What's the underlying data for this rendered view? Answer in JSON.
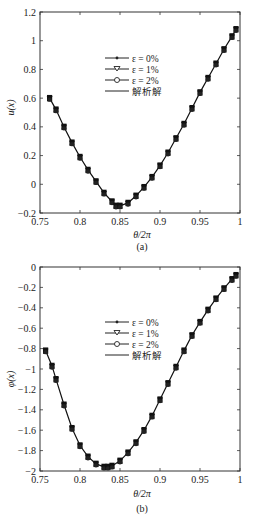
{
  "chart_data": [
    {
      "type": "line",
      "panel": "(a)",
      "title": "",
      "xlabel": "θ/2π",
      "ylabel": "u(x)",
      "xlim": [
        0.75,
        1.0
      ],
      "ylim": [
        -0.2,
        1.2
      ],
      "xticks": [
        "0.75",
        "0.8",
        "0.85",
        "0.9",
        "0.95",
        "1"
      ],
      "yticks": [
        "-0.2",
        "0",
        "0.2",
        "0.4",
        "0.6",
        "0.8",
        "1",
        "1.2"
      ],
      "legend": [
        "ε = 0%",
        "ε = 1%",
        "ε = 2%",
        "解析解"
      ],
      "legend_position": "upper-center",
      "grid": false,
      "x": [
        0.762,
        0.77,
        0.78,
        0.79,
        0.8,
        0.81,
        0.82,
        0.83,
        0.84,
        0.845,
        0.85,
        0.86,
        0.87,
        0.88,
        0.89,
        0.9,
        0.91,
        0.92,
        0.93,
        0.94,
        0.95,
        0.96,
        0.97,
        0.98,
        0.99,
        0.995
      ],
      "series": [
        {
          "name": "ε = 0%",
          "values": [
            0.6,
            0.52,
            0.4,
            0.29,
            0.19,
            0.1,
            0.02,
            -0.06,
            -0.12,
            -0.15,
            -0.15,
            -0.13,
            -0.08,
            -0.02,
            0.05,
            0.13,
            0.22,
            0.32,
            0.42,
            0.53,
            0.64,
            0.74,
            0.84,
            0.94,
            1.03,
            1.08
          ]
        },
        {
          "name": "ε = 1%",
          "values": [
            0.6,
            0.52,
            0.4,
            0.29,
            0.19,
            0.1,
            0.02,
            -0.06,
            -0.12,
            -0.15,
            -0.15,
            -0.13,
            -0.08,
            -0.02,
            0.05,
            0.13,
            0.22,
            0.32,
            0.42,
            0.53,
            0.64,
            0.74,
            0.84,
            0.94,
            1.03,
            1.08
          ]
        },
        {
          "name": "ε = 2%",
          "values": [
            0.6,
            0.52,
            0.4,
            0.29,
            0.19,
            0.1,
            0.02,
            -0.06,
            -0.12,
            -0.15,
            -0.15,
            -0.13,
            -0.08,
            -0.02,
            0.05,
            0.13,
            0.22,
            0.32,
            0.42,
            0.53,
            0.64,
            0.74,
            0.84,
            0.94,
            1.03,
            1.08
          ]
        },
        {
          "name": "解析解",
          "values": [
            0.6,
            0.52,
            0.4,
            0.29,
            0.19,
            0.1,
            0.02,
            -0.06,
            -0.12,
            -0.15,
            -0.15,
            -0.13,
            -0.08,
            -0.02,
            0.05,
            0.13,
            0.22,
            0.32,
            0.42,
            0.53,
            0.64,
            0.74,
            0.84,
            0.94,
            1.03,
            1.08
          ]
        }
      ]
    },
    {
      "type": "line",
      "panel": "(b)",
      "title": "",
      "xlabel": "θ/2π",
      "ylabel": "φ(x)",
      "xlim": [
        0.75,
        1.0
      ],
      "ylim": [
        -2.0,
        0.0
      ],
      "xticks": [
        "0.75",
        "0.8",
        "0.85",
        "0.9",
        "0.95",
        "1"
      ],
      "yticks": [
        "-2",
        "-1.8",
        "-1.6",
        "-1.4",
        "-1.2",
        "-1",
        "-0.8",
        "-0.6",
        "-0.4",
        "-0.2",
        "0"
      ],
      "legend": [
        "ε = 0%",
        "ε = 1%",
        "ε = 2%",
        "解析解"
      ],
      "legend_position": "upper-center",
      "grid": false,
      "x": [
        0.757,
        0.765,
        0.77,
        0.78,
        0.79,
        0.8,
        0.81,
        0.82,
        0.83,
        0.835,
        0.84,
        0.85,
        0.86,
        0.87,
        0.88,
        0.89,
        0.9,
        0.91,
        0.92,
        0.93,
        0.94,
        0.95,
        0.96,
        0.97,
        0.98,
        0.99,
        0.995
      ],
      "series": [
        {
          "name": "ε = 0%",
          "values": [
            -0.82,
            -0.97,
            -1.1,
            -1.35,
            -1.58,
            -1.75,
            -1.86,
            -1.93,
            -1.96,
            -1.96,
            -1.95,
            -1.9,
            -1.82,
            -1.72,
            -1.6,
            -1.46,
            -1.3,
            -1.14,
            -0.98,
            -0.82,
            -0.67,
            -0.54,
            -0.42,
            -0.31,
            -0.21,
            -0.12,
            -0.08
          ]
        },
        {
          "name": "ε = 1%",
          "values": [
            -0.82,
            -0.97,
            -1.1,
            -1.35,
            -1.58,
            -1.75,
            -1.86,
            -1.93,
            -1.96,
            -1.96,
            -1.95,
            -1.9,
            -1.82,
            -1.72,
            -1.6,
            -1.46,
            -1.3,
            -1.14,
            -0.98,
            -0.82,
            -0.67,
            -0.54,
            -0.42,
            -0.31,
            -0.21,
            -0.12,
            -0.08
          ]
        },
        {
          "name": "ε = 2%",
          "values": [
            -0.82,
            -0.97,
            -1.1,
            -1.35,
            -1.58,
            -1.75,
            -1.86,
            -1.93,
            -1.96,
            -1.96,
            -1.95,
            -1.9,
            -1.82,
            -1.72,
            -1.6,
            -1.46,
            -1.3,
            -1.14,
            -0.98,
            -0.82,
            -0.67,
            -0.54,
            -0.42,
            -0.31,
            -0.21,
            -0.12,
            -0.08
          ]
        },
        {
          "name": "解析解",
          "values": [
            -0.82,
            -0.97,
            -1.1,
            -1.35,
            -1.58,
            -1.75,
            -1.86,
            -1.93,
            -1.96,
            -1.96,
            -1.95,
            -1.9,
            -1.82,
            -1.72,
            -1.6,
            -1.46,
            -1.3,
            -1.14,
            -0.98,
            -0.82,
            -0.67,
            -0.54,
            -0.42,
            -0.31,
            -0.21,
            -0.12,
            -0.08
          ]
        }
      ]
    }
  ]
}
